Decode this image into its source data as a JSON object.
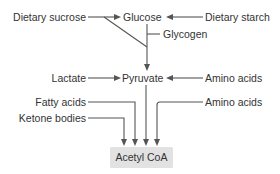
{
  "diagram": {
    "nodes": {
      "dietary_sucrose": "Dietary sucrose",
      "glucose": "Glucose",
      "dietary_starch": "Dietary starch",
      "glycogen": "Glycogen",
      "lactate": "Lactate",
      "pyruvate": "Pyruvate",
      "amino_acids_pyruvate": "Amino acids",
      "fatty_acids": "Fatty acids",
      "amino_acids_acetyl": "Amino acids",
      "ketone_bodies": "Ketone bodies",
      "acetyl_coa": "Acetyl CoA"
    },
    "edges": [
      {
        "from": "Dietary sucrose",
        "to": "Glucose"
      },
      {
        "from": "Dietary starch",
        "to": "Glucose"
      },
      {
        "from": "Dietary sucrose",
        "to": "Pyruvate"
      },
      {
        "from": "Glucose",
        "to": "Pyruvate"
      },
      {
        "from": "Glycogen",
        "to": "Pyruvate"
      },
      {
        "from": "Lactate",
        "to": "Pyruvate"
      },
      {
        "from": "Amino acids",
        "to": "Pyruvate"
      },
      {
        "from": "Fatty acids",
        "to": "Acetyl CoA"
      },
      {
        "from": "Ketone bodies",
        "to": "Acetyl CoA"
      },
      {
        "from": "Pyruvate",
        "to": "Acetyl CoA"
      },
      {
        "from": "Amino acids",
        "to": "Acetyl CoA"
      }
    ],
    "colors": {
      "line": "#555555",
      "text": "#333333",
      "target_box": "#e2e2e2"
    }
  }
}
